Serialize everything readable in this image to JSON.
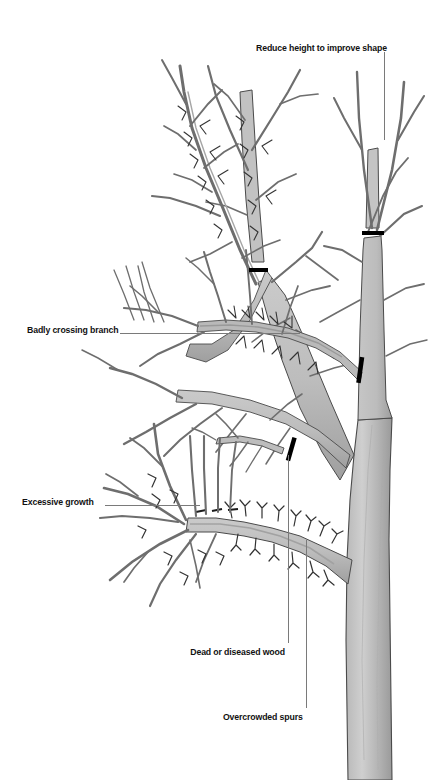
{
  "figure": {
    "type": "diagram",
    "background_color": "#ffffff",
    "width": 431,
    "height": 780
  },
  "palette": {
    "branch_fill_light": "#c9c9c9",
    "branch_fill_mid": "#b0b0b0",
    "branch_fill_dark": "#8f8f8f",
    "outline": "#4a4a4a",
    "twig": "#6e6e6e",
    "label_text": "#111111",
    "leader_line": "#7a7a7a",
    "prune_mark": "#000000"
  },
  "callouts": [
    {
      "id": "reduce-height",
      "label": "Reduce height to improve shape",
      "align": "left",
      "x": 256,
      "y": 43,
      "leader": {
        "type": "vertical",
        "x": 384,
        "y1": 52,
        "y2": 140
      }
    },
    {
      "id": "badly-crossing-branch",
      "label": "Badly crossing branch",
      "align": "left",
      "x": 27,
      "y": 325,
      "leader": {
        "type": "horizontal",
        "y": 333,
        "x1": 120,
        "x2": 300
      }
    },
    {
      "id": "excessive-growth",
      "label": "Excessive growth",
      "align": "left",
      "x": 22,
      "y": 497,
      "leader": {
        "type": "horizontal",
        "y": 505,
        "x1": 105,
        "x2": 200
      }
    },
    {
      "id": "dead-or-diseased-wood",
      "label": "Dead or diseased wood",
      "align": "right",
      "x": 285,
      "y": 647,
      "leader": {
        "type": "vertical",
        "x": 288,
        "y1": 455,
        "y2": 643
      }
    },
    {
      "id": "overcrowded-spurs",
      "label": "Overcrowded spurs",
      "align": "right",
      "x": 304,
      "y": 712,
      "leader": {
        "type": "vertical",
        "x": 306,
        "y1": 540,
        "y2": 708
      }
    }
  ],
  "prune_marks": [
    {
      "id": "prune-mark-upper-right",
      "x": 362,
      "y": 231,
      "width": 22,
      "height": 4,
      "angle": 0
    },
    {
      "id": "prune-mark-center-leader",
      "x": 249,
      "y": 268,
      "width": 19,
      "height": 4,
      "angle": 0
    },
    {
      "id": "prune-mark-crossing-branch",
      "x": 358,
      "y": 357,
      "width": 4,
      "height": 25,
      "angle": 10
    },
    {
      "id": "prune-mark-dead-wood",
      "x": 289,
      "y": 437,
      "width": 4,
      "height": 23,
      "angle": 18
    }
  ],
  "legend_note": ""
}
